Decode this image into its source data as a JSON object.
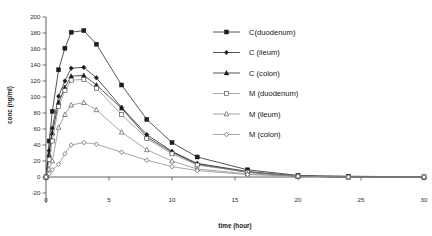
{
  "chart_data": {
    "type": "line",
    "title": "",
    "xlabel": "time (hour)",
    "ylabel": "conc (ng/ml)",
    "xlim": [
      0,
      30
    ],
    "ylim": [
      -20,
      200
    ],
    "x_ticks": [
      0,
      5,
      10,
      15,
      20,
      25,
      30
    ],
    "y_ticks": [
      -20,
      0,
      20,
      40,
      60,
      80,
      100,
      120,
      140,
      160,
      180,
      200
    ],
    "grid": false,
    "legend_position": "top-right inside plot area",
    "x": [
      0,
      0.25,
      0.5,
      1,
      1.5,
      2,
      3,
      4,
      6,
      8,
      10,
      12,
      16,
      20,
      24,
      30
    ],
    "series": [
      {
        "name": "C(duodenum)",
        "marker": "filled-square",
        "color": "#1c1c1c",
        "values": [
          0,
          45,
          82,
          134,
          161,
          181,
          183,
          166,
          115,
          72,
          43,
          25,
          9,
          2,
          1,
          0
        ]
      },
      {
        "name": "C (ileum)",
        "marker": "filled-diamond",
        "color": "#1c1c1c",
        "values": [
          0,
          33,
          61,
          101,
          120,
          136,
          137,
          124,
          87,
          53,
          32,
          17,
          7,
          1,
          0,
          0
        ]
      },
      {
        "name": "C (colon)",
        "marker": "filled-triangle",
        "color": "#1c1c1c",
        "values": [
          0,
          28,
          55,
          93,
          112,
          126,
          127,
          115,
          86,
          50,
          31,
          16,
          6,
          1,
          0,
          0
        ]
      },
      {
        "name": "M (duodenum)",
        "marker": "open-square",
        "color": "#8a8a8a",
        "values": [
          0,
          22,
          45,
          88,
          108,
          121,
          122,
          111,
          78,
          48,
          29,
          15,
          6,
          1,
          0,
          0
        ]
      },
      {
        "name": "M (ileum)",
        "marker": "open-triangle",
        "color": "#8a8a8a",
        "values": [
          0,
          10,
          20,
          62,
          78,
          90,
          93,
          84,
          56,
          34,
          20,
          10,
          4,
          1,
          0,
          0
        ]
      },
      {
        "name": "M (colon)",
        "marker": "open-diamond",
        "color": "#8a8a8a",
        "values": [
          0,
          4,
          9,
          16,
          29,
          40,
          43,
          41,
          31,
          21,
          13,
          8,
          3,
          1,
          0,
          0
        ]
      }
    ]
  }
}
